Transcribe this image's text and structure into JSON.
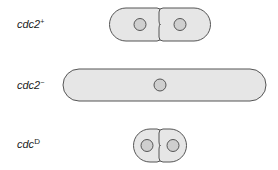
{
  "colors": {
    "cell_fill": "#e6e6e6",
    "cell_stroke": "#555555",
    "nucleus_fill": "#cfcfcf",
    "nucleus_stroke": "#555555",
    "label_text": "#222222"
  },
  "rows": [
    {
      "id": "wild-type",
      "label_base": "cdc2",
      "label_super": "+",
      "cell_shape": "two daughter cells, normal length, dividing",
      "nuclei": 2
    },
    {
      "id": "loss-of-function",
      "label_base": "cdc2",
      "label_super": "−",
      "cell_shape": "single elongated cell",
      "nuclei": 1
    },
    {
      "id": "dominant",
      "label_base": "cdc",
      "label_super": "D",
      "cell_shape": "two small daughter cells, dividing prematurely",
      "nuclei": 2
    }
  ]
}
